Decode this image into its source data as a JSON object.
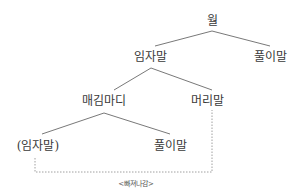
{
  "diagram": {
    "type": "syntax-tree",
    "nodes": {
      "root": "월",
      "subject": "임자말",
      "predicate_top": "풀이말",
      "relative_clause": "매김마디",
      "head_noun": "머리말",
      "gap_subject": "(임자말)",
      "predicate_inner": "풀이말"
    },
    "edges": [
      [
        "월",
        "임자말"
      ],
      [
        "월",
        "풀이말"
      ],
      [
        "임자말",
        "매김마디"
      ],
      [
        "임자말",
        "머리말"
      ],
      [
        "매김마디",
        "(임자말)"
      ],
      [
        "매김마디",
        "풀이말"
      ]
    ],
    "annotation": {
      "label": "<빠져나감>",
      "connects": [
        "(임자말)",
        "머리말"
      ],
      "style": "dashed"
    },
    "colors": {
      "line": "#555555",
      "dashed": "#888888",
      "text": "#3a3a3a"
    }
  }
}
